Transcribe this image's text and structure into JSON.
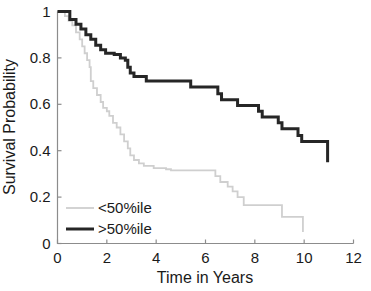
{
  "chart_data": {
    "type": "line",
    "title": "",
    "subtitle": "",
    "xlabel": "Time in Years",
    "ylabel": "Survival Probability",
    "xlim": [
      0,
      12
    ],
    "ylim": [
      0,
      1
    ],
    "xticks": [
      "0",
      "2",
      "4",
      "6",
      "8",
      "10",
      "12"
    ],
    "xtick_values": [
      0,
      2,
      4,
      6,
      8,
      10,
      12
    ],
    "yticks": [
      "0",
      "0.2",
      "0.4",
      "0.6",
      "0.8",
      "1"
    ],
    "ytick_values": [
      0,
      0.2,
      0.4,
      0.6,
      0.8,
      1
    ],
    "grid": false,
    "legend_position": "lower-left",
    "annotations": [],
    "series": [
      {
        "name": "<50%ile",
        "color": "#cfcfcf",
        "style": "step-post",
        "points": [
          [
            0.0,
            1.0
          ],
          [
            0.2,
            1.0
          ],
          [
            0.3,
            0.98
          ],
          [
            0.45,
            0.96
          ],
          [
            0.6,
            0.94
          ],
          [
            0.75,
            0.91
          ],
          [
            0.9,
            0.88
          ],
          [
            1.0,
            0.85
          ],
          [
            1.1,
            0.82
          ],
          [
            1.2,
            0.79
          ],
          [
            1.3,
            0.76
          ],
          [
            1.35,
            0.7
          ],
          [
            1.45,
            0.67
          ],
          [
            1.6,
            0.64
          ],
          [
            1.75,
            0.61
          ],
          [
            1.85,
            0.585
          ],
          [
            2.0,
            0.57
          ],
          [
            2.1,
            0.55
          ],
          [
            2.25,
            0.52
          ],
          [
            2.4,
            0.5
          ],
          [
            2.55,
            0.47
          ],
          [
            2.7,
            0.44
          ],
          [
            2.85,
            0.41
          ],
          [
            2.95,
            0.38
          ],
          [
            3.1,
            0.36
          ],
          [
            3.3,
            0.345
          ],
          [
            3.5,
            0.335
          ],
          [
            3.9,
            0.325
          ],
          [
            4.4,
            0.32
          ],
          [
            4.6,
            0.315
          ],
          [
            6.1,
            0.315
          ],
          [
            6.4,
            0.29
          ],
          [
            6.6,
            0.265
          ],
          [
            6.9,
            0.245
          ],
          [
            7.1,
            0.225
          ],
          [
            7.3,
            0.2
          ],
          [
            7.55,
            0.165
          ],
          [
            8.9,
            0.165
          ],
          [
            9.1,
            0.115
          ],
          [
            9.85,
            0.115
          ],
          [
            9.95,
            0.05
          ]
        ]
      },
      {
        "name": ">50%ile",
        "color": "#262626",
        "style": "step-post",
        "points": [
          [
            0.0,
            1.0
          ],
          [
            0.35,
            1.0
          ],
          [
            0.5,
            0.965
          ],
          [
            0.75,
            0.945
          ],
          [
            0.95,
            0.925
          ],
          [
            1.15,
            0.9
          ],
          [
            1.35,
            0.88
          ],
          [
            1.55,
            0.855
          ],
          [
            1.75,
            0.835
          ],
          [
            1.95,
            0.82
          ],
          [
            2.3,
            0.815
          ],
          [
            2.55,
            0.8
          ],
          [
            2.75,
            0.79
          ],
          [
            2.85,
            0.76
          ],
          [
            2.95,
            0.735
          ],
          [
            3.1,
            0.72
          ],
          [
            3.5,
            0.72
          ],
          [
            3.6,
            0.7
          ],
          [
            5.25,
            0.7
          ],
          [
            5.4,
            0.675
          ],
          [
            6.35,
            0.675
          ],
          [
            6.5,
            0.645
          ],
          [
            6.65,
            0.62
          ],
          [
            7.15,
            0.62
          ],
          [
            7.3,
            0.595
          ],
          [
            8.0,
            0.595
          ],
          [
            8.15,
            0.57
          ],
          [
            8.3,
            0.545
          ],
          [
            8.8,
            0.545
          ],
          [
            8.95,
            0.52
          ],
          [
            9.1,
            0.495
          ],
          [
            9.6,
            0.495
          ],
          [
            9.75,
            0.465
          ],
          [
            9.9,
            0.44
          ],
          [
            10.85,
            0.44
          ],
          [
            10.95,
            0.35
          ]
        ]
      }
    ]
  },
  "legend": {
    "items": [
      {
        "label": "<50%ile"
      },
      {
        "label": ">50%ile"
      }
    ]
  }
}
